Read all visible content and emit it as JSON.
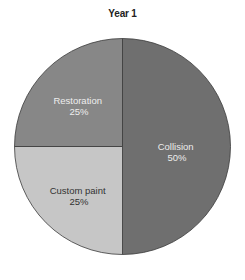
{
  "chart_data": {
    "type": "pie",
    "title": "Year 1",
    "slices": [
      {
        "label": "Collision",
        "value": 50,
        "pct_label": "50%",
        "color": "#6f6f6f",
        "text_color": "#ececec"
      },
      {
        "label": "Custom paint",
        "value": 25,
        "pct_label": "25%",
        "color": "#c6c6c6",
        "text_color": "#333333"
      },
      {
        "label": "Restoration",
        "value": 25,
        "pct_label": "25%",
        "color": "#878787",
        "text_color": "#eeeeee"
      }
    ],
    "start_angle": "12 o'clock, clockwise",
    "legend": "none (labels inside slices)"
  }
}
